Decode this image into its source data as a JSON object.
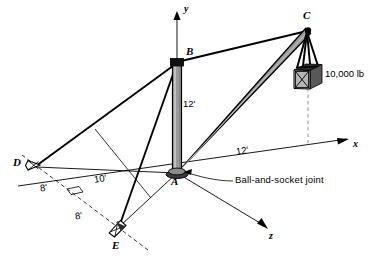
{
  "figure": {
    "kind": "statics-free-body-diagram",
    "background_color": "#ffffff",
    "line_color": "#000000",
    "member_fill_color": "#9a9a9a",
    "crate_fill_color": "#b5b5b5"
  },
  "points": {
    "A": {
      "label": "A",
      "x": 177,
      "y": 173,
      "label_x": 171,
      "label_y": 180
    },
    "B": {
      "label": "B",
      "x": 177,
      "y": 62,
      "label_x": 185,
      "label_y": 49
    },
    "C": {
      "label": "C",
      "x": 308,
      "y": 30,
      "label_x": 303,
      "label_y": 14
    },
    "D": {
      "label": "D",
      "x": 33,
      "y": 165,
      "label_x": 13,
      "label_y": 162
    },
    "E": {
      "label": "E",
      "x": 117,
      "y": 228,
      "label_x": 112,
      "label_y": 240
    }
  },
  "axes": {
    "y": {
      "label": "y",
      "label_x": 184,
      "label_y": 7,
      "tip_x": 177,
      "tip_y": 13
    },
    "x": {
      "label": "x",
      "label_x": 353,
      "label_y": 143,
      "tip_x": 349,
      "tip_y": 139
    },
    "z": {
      "label": "z",
      "label_x": 269,
      "label_y": 235,
      "tip_x": 267,
      "tip_y": 228
    }
  },
  "dimensions": [
    {
      "id": "mast-height",
      "label": "12'",
      "x": 183,
      "y": 104
    },
    {
      "id": "boom-horizontal-run",
      "label": "12'",
      "x": 238,
      "y": 150
    },
    {
      "id": "x-axis-to-D-offset",
      "label": "10'",
      "x": 98,
      "y": 178
    },
    {
      "id": "D-offset",
      "label": "8'",
      "x": 42,
      "y": 188
    },
    {
      "id": "E-offset",
      "label": "8'",
      "x": 76,
      "y": 215
    }
  ],
  "annotations": [
    {
      "id": "joint-note",
      "label": "Ball-and-socket joint",
      "x": 235,
      "y": 179
    },
    {
      "id": "load-note",
      "label": "10,000 lb",
      "x": 325,
      "y": 73
    }
  ],
  "members": [
    {
      "id": "mast-AB",
      "from": "A",
      "to": "B",
      "style": "thick-member"
    },
    {
      "id": "boom-AC",
      "from": "A",
      "to": "C",
      "style": "thick-member"
    },
    {
      "id": "cable-BC",
      "from": "B",
      "to": "C",
      "style": "cable"
    },
    {
      "id": "cable-BD",
      "from": "B",
      "to": "D",
      "style": "cable"
    },
    {
      "id": "cable-BE",
      "from": "B",
      "to": "E",
      "style": "cable"
    },
    {
      "id": "cable-AD",
      "from": "A",
      "to": "D",
      "style": "thin-line"
    },
    {
      "id": "cable-AE",
      "from": "A",
      "to": "E",
      "style": "thin-line"
    }
  ]
}
